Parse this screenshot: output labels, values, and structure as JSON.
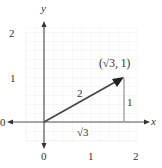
{
  "diagram": {
    "type": "vector-on-coordinate-grid",
    "axes": {
      "x_label": "x",
      "y_label": "y",
      "x_ticks": [
        "0",
        "1",
        "2"
      ],
      "y_ticks": [
        "1",
        "2"
      ],
      "left_arrow_label": "0"
    },
    "vector": {
      "from": [
        0,
        0
      ],
      "to_label": "(√3, 1)",
      "magnitude_label": "2",
      "horizontal_leg_label": "√3",
      "vertical_leg_label": "1"
    },
    "colors": {
      "grid": "#e6e6e6",
      "axis": "#555555",
      "vector": "#444444",
      "leg": "#9a9a9a",
      "text": "#333333"
    }
  }
}
